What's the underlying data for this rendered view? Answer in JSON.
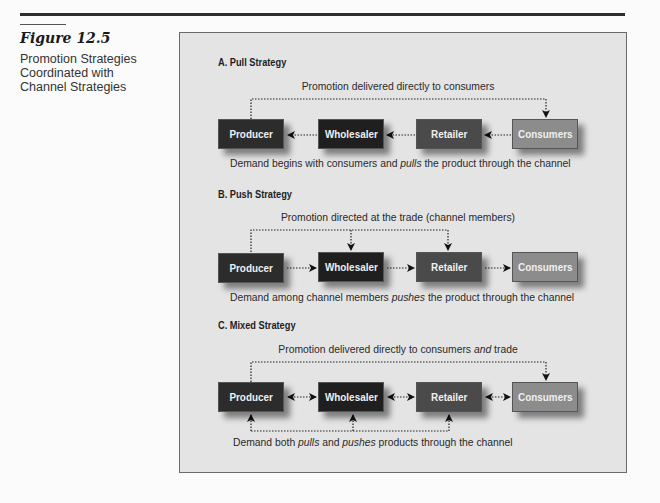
{
  "figure": {
    "number": "Figure 12.5",
    "title": "Promotion Strategies Coordinated with Channel Strategies"
  },
  "colors": {
    "producer": "#2c2c2c",
    "wholesaler": "#1f1f1f",
    "retailer": "#4a4a4a",
    "consumers": "#8c8c8c",
    "panel_bg": "#e4e4e4"
  },
  "nodes": [
    "Producer",
    "Wholesaler",
    "Retailer",
    "Consumers"
  ],
  "sections": {
    "pull": {
      "title": "A.  Pull Strategy",
      "promo_label": "Promotion delivered directly to consumers",
      "demand_pre": "Demand begins with consumers and ",
      "demand_em": "pulls",
      "demand_post": " the product through the channel",
      "boxes": {
        "producer": "Producer",
        "wholesaler": "Wholesaler",
        "retailer": "Retailer",
        "consumers": "Consumers"
      }
    },
    "push": {
      "title": "B.  Push Strategy",
      "promo_label": "Promotion directed at the trade (channel members)",
      "demand_pre": "Demand among channel members ",
      "demand_em": "pushes",
      "demand_post": " the product through the channel",
      "boxes": {
        "producer": "Producer",
        "wholesaler": "Wholesaler",
        "retailer": "Retailer",
        "consumers": "Consumers"
      }
    },
    "mixed": {
      "title": "C.  Mixed Strategy",
      "promo_pre": "Promotion delivered directly to consumers ",
      "promo_em": "and",
      "promo_post": " trade",
      "demand_pre": "Demand both ",
      "demand_em1": "pulls",
      "demand_mid": " and ",
      "demand_em2": "pushes",
      "demand_post": " products through the channel",
      "boxes": {
        "producer": "Producer",
        "wholesaler": "Wholesaler",
        "retailer": "Retailer",
        "consumers": "Consumers"
      }
    }
  }
}
